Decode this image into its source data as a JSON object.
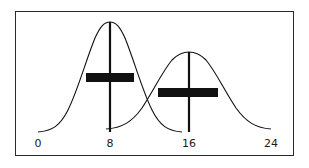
{
  "diagram": {
    "type": "two overlapping normal distributions with mean markers and spread bars",
    "axis": {
      "ticks": [
        {
          "value": "0",
          "x": 38
        },
        {
          "value": "8",
          "x": 110
        },
        {
          "value": "16",
          "x": 189
        },
        {
          "value": "24",
          "x": 271
        }
      ]
    },
    "distributions": [
      {
        "name": "distribution-1",
        "mean": 8,
        "peak_height": "tall",
        "spread_bar": {
          "from": 5.4,
          "to": 10.6
        }
      },
      {
        "name": "distribution-2",
        "mean": 16,
        "peak_height": "shorter",
        "spread_bar": {
          "from": 13.3,
          "to": 19.7
        }
      }
    ],
    "colors": {
      "ink": "#111111",
      "frame": "#2a2a2a",
      "background": "#ffffff"
    }
  }
}
